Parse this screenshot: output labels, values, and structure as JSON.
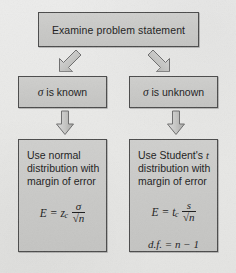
{
  "diagram": {
    "colors": {
      "box_fill": "#c9c9c7",
      "box_border": "#4a4a4a",
      "page_background": "#e8e8e6",
      "text": "#1b1b1b",
      "arrow_fill": "#c2c2c0",
      "arrow_border": "#6a6a6a"
    },
    "nodes": {
      "start": {
        "label": "Examine problem statement"
      },
      "branch_known": {
        "symbol": "σ",
        "label": "is known",
        "full_label": "σ is known"
      },
      "branch_unknown": {
        "symbol": "σ",
        "label": "is unknown",
        "full_label": "σ is unknown"
      },
      "result_normal": {
        "line1": "Use normal",
        "line2": "distribution with",
        "line3": "margin of error",
        "formula": {
          "lhs": "E",
          "equals": "=",
          "coefficient": "z",
          "coefficient_sub": "c",
          "numerator": "σ",
          "denominator": "√n",
          "plain": "E = z_c σ/√n"
        }
      },
      "result_student": {
        "line1": "Use Student's t",
        "line1_plain": "Use Student's",
        "line1_italic": "t",
        "line2": "distribution with",
        "line3": "margin of error",
        "formula": {
          "lhs": "E",
          "equals": "=",
          "coefficient": "t",
          "coefficient_sub": "c",
          "numerator": "s",
          "denominator": "√n",
          "plain": "E = t_c s/√n"
        },
        "degrees_of_freedom": "d.f. = n − 1"
      }
    },
    "arrows": [
      {
        "name": "start-to-known",
        "direction": "down-left",
        "style": "3d-block-arrow"
      },
      {
        "name": "start-to-unknown",
        "direction": "down-right",
        "style": "3d-block-arrow"
      },
      {
        "name": "known-to-normal",
        "direction": "down",
        "style": "3d-block-arrow"
      },
      {
        "name": "unknown-to-student",
        "direction": "down",
        "style": "3d-block-arrow"
      }
    ]
  }
}
